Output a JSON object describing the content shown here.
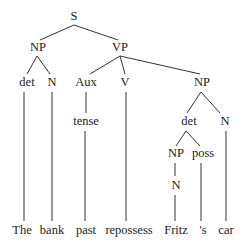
{
  "diagram": {
    "type": "syntax-parse-tree",
    "colors": {
      "text": "#222222",
      "edge": "#333333",
      "background": "#ffffff"
    },
    "nodes": [
      {
        "id": "S",
        "label": "S",
        "x": 74,
        "y": 20
      },
      {
        "id": "NP1",
        "label": "NP",
        "x": 38,
        "y": 51
      },
      {
        "id": "VP",
        "label": "VP",
        "x": 120,
        "y": 51
      },
      {
        "id": "det1",
        "label": "det",
        "x": 27,
        "y": 86
      },
      {
        "id": "N1",
        "label": "N",
        "x": 52,
        "y": 86
      },
      {
        "id": "Aux",
        "label": "Aux",
        "x": 86,
        "y": 86
      },
      {
        "id": "V",
        "label": "V",
        "x": 125,
        "y": 86
      },
      {
        "id": "NP2",
        "label": "NP",
        "x": 202,
        "y": 86
      },
      {
        "id": "tense",
        "label": "tense",
        "x": 86,
        "y": 125
      },
      {
        "id": "det2",
        "label": "det",
        "x": 189,
        "y": 125
      },
      {
        "id": "N2",
        "label": "N",
        "x": 225,
        "y": 125
      },
      {
        "id": "NP3",
        "label": "NP",
        "x": 176,
        "y": 157
      },
      {
        "id": "poss",
        "label": "poss",
        "x": 203,
        "y": 157
      },
      {
        "id": "N3",
        "label": "N",
        "x": 176,
        "y": 189
      },
      {
        "id": "w_the",
        "label": "The",
        "x": 22,
        "y": 234
      },
      {
        "id": "w_bank",
        "label": "bank",
        "x": 52,
        "y": 234
      },
      {
        "id": "w_past",
        "label": "past",
        "x": 86,
        "y": 234
      },
      {
        "id": "w_rep",
        "label": "repossess",
        "x": 129,
        "y": 234
      },
      {
        "id": "w_fritz",
        "label": "Fritz",
        "x": 176,
        "y": 234
      },
      {
        "id": "w_s",
        "label": "'s",
        "x": 203,
        "y": 234
      },
      {
        "id": "w_car",
        "label": "car",
        "x": 226,
        "y": 234
      }
    ],
    "edges": [
      {
        "from": "S",
        "to": "NP1",
        "x1": 74,
        "y1": 25,
        "x2": 40,
        "y2": 40
      },
      {
        "from": "S",
        "to": "VP",
        "x1": 74,
        "y1": 25,
        "x2": 118,
        "y2": 40
      },
      {
        "from": "NP1",
        "to": "det1",
        "x1": 37,
        "y1": 56,
        "x2": 27,
        "y2": 74
      },
      {
        "from": "NP1",
        "to": "N1",
        "x1": 37,
        "y1": 56,
        "x2": 50,
        "y2": 74
      },
      {
        "from": "VP",
        "to": "Aux",
        "x1": 120,
        "y1": 56,
        "x2": 90,
        "y2": 74
      },
      {
        "from": "VP",
        "to": "V",
        "x1": 120,
        "y1": 56,
        "x2": 125,
        "y2": 74
      },
      {
        "from": "VP",
        "to": "NP2",
        "x1": 120,
        "y1": 56,
        "x2": 200,
        "y2": 74
      },
      {
        "from": "det1",
        "to": "w_the",
        "x1": 24,
        "y1": 92,
        "x2": 24,
        "y2": 221
      },
      {
        "from": "N1",
        "to": "w_bank",
        "x1": 52,
        "y1": 92,
        "x2": 52,
        "y2": 221
      },
      {
        "from": "Aux",
        "to": "tense",
        "x1": 86,
        "y1": 92,
        "x2": 86,
        "y2": 113
      },
      {
        "from": "tense",
        "to": "w_past",
        "x1": 85,
        "y1": 131,
        "x2": 85,
        "y2": 221
      },
      {
        "from": "V",
        "to": "w_rep",
        "x1": 126,
        "y1": 92,
        "x2": 126,
        "y2": 221
      },
      {
        "from": "NP2",
        "to": "det2",
        "x1": 201,
        "y1": 92,
        "x2": 187,
        "y2": 113
      },
      {
        "from": "NP2",
        "to": "N2",
        "x1": 201,
        "y1": 92,
        "x2": 220,
        "y2": 113
      },
      {
        "from": "det2",
        "to": "NP3",
        "x1": 186,
        "y1": 131,
        "x2": 176,
        "y2": 146
      },
      {
        "from": "det2",
        "to": "poss",
        "x1": 186,
        "y1": 131,
        "x2": 200,
        "y2": 146
      },
      {
        "from": "N2",
        "to": "w_car",
        "x1": 226,
        "y1": 131,
        "x2": 226,
        "y2": 221
      },
      {
        "from": "NP3",
        "to": "N3",
        "x1": 175,
        "y1": 163,
        "x2": 175,
        "y2": 176
      },
      {
        "from": "poss",
        "to": "w_s",
        "x1": 201,
        "y1": 163,
        "x2": 201,
        "y2": 221
      },
      {
        "from": "N3",
        "to": "w_fritz",
        "x1": 175,
        "y1": 195,
        "x2": 175,
        "y2": 221
      }
    ]
  }
}
